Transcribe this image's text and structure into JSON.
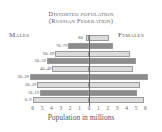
{
  "chart_data": {
    "type": "bar",
    "subtype": "population-pyramid",
    "title": "Distorted population",
    "subtitle": "(Russian Federation)",
    "xlabel": "Population in millions",
    "ylabel": "",
    "left_label": "Males",
    "right_label": "Females",
    "categories": [
      "80+",
      "70–79",
      "60–69",
      "50–59",
      "40–49",
      "30–39",
      "20–29",
      "10–19",
      "0–9"
    ],
    "series": [
      {
        "name": "Males",
        "values": [
          0.3,
          2.2,
          3.6,
          4.5,
          3.9,
          6.3,
          5.5,
          5.2,
          6.0
        ]
      },
      {
        "name": "Females",
        "values": [
          2.1,
          2.6,
          4.4,
          5.0,
          4.7,
          6.3,
          5.4,
          5.1,
          5.8
        ]
      }
    ],
    "xlim": [
      -6,
      6
    ],
    "x_ticks": [
      "6",
      "5",
      "4",
      "3",
      "2",
      "1",
      "0",
      "1",
      "2",
      "3",
      "4",
      "5",
      "6"
    ],
    "grid": false,
    "legend": "none",
    "colors": {
      "dark": "#8c8c8c",
      "light": "#dcdcdc"
    }
  },
  "title_line1": "Distorted population",
  "title_line2": "(Russian Federation)",
  "males_label": "Males",
  "females_label": "Females",
  "xlabel": "Population in millions"
}
